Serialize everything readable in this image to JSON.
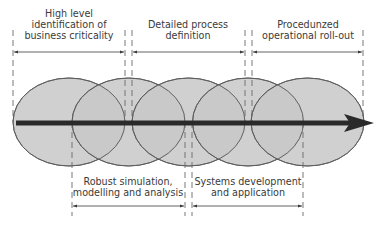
{
  "diagram": {
    "colors": {
      "ellipse_fill": "#c8c8c8",
      "ellipse_stroke": "#5a5a5a",
      "arrow": "#2a2a2a",
      "guide": "#6a6a6a",
      "text": "#3a3a3a"
    },
    "phases_top": [
      {
        "lines": [
          "High level",
          "identification of",
          "business criticality"
        ]
      },
      {
        "lines": [
          "Detailed process",
          "definition"
        ]
      },
      {
        "lines": [
          "Procedunzed",
          "operational roll-out"
        ]
      }
    ],
    "phases_bottom": [
      {
        "lines": [
          "Robust simulation,",
          "modelling and analysis"
        ]
      },
      {
        "lines": [
          "Systems development",
          "and application"
        ]
      }
    ],
    "ellipse_count": 5
  }
}
